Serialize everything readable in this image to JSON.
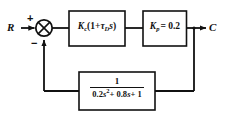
{
  "diagram": {
    "line_color": "#111111",
    "background": "#ffffff",
    "signals": {
      "input_label": "R",
      "output_label": "C"
    },
    "summing_junction": {
      "name": "summing-junction",
      "glyph": "circle-with-x",
      "plus_sign": "+",
      "minus_sign": "−"
    },
    "blocks": [
      {
        "id": "controller",
        "name": "controller-block",
        "gain_symbol": "K",
        "gain_subscript": "c",
        "expression_plain": "Kc(1 + τD s)",
        "open_paren": "(1+",
        "tau_symbol": "τ",
        "tau_subscript": "D",
        "s_symbol": "s",
        "close_paren": ")"
      },
      {
        "id": "process",
        "name": "process-gain-block",
        "gain_symbol": "K",
        "gain_subscript": "p",
        "equals": "= 0.2",
        "expression_plain": "Kp = 0.2",
        "value": "0.2"
      },
      {
        "id": "feedback",
        "name": "feedback-block",
        "expression_plain": "1 / (0.2s^2 + 0.8s + 1)",
        "numerator": "1",
        "denominator_a": "0.2",
        "denominator_s": "s",
        "denominator_exp": "2",
        "denominator_b": "+ 0.8",
        "denominator_s2": "s",
        "denominator_c": "+ 1"
      }
    ]
  }
}
